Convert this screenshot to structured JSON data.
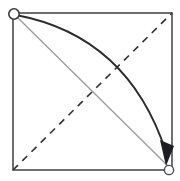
{
  "figure": {
    "canvas": {
      "width": 180,
      "height": 181,
      "background": "#ffffff"
    },
    "square": {
      "name": "square-outline",
      "x": 13,
      "y": 13,
      "width": 159,
      "height": 157,
      "stroke": "#4a4a52",
      "stroke_width": 1.6,
      "fill": "none"
    },
    "dashed_diagonal": {
      "name": "dashed-diagonal-line",
      "from": [
        13,
        170
      ],
      "to": [
        172,
        13
      ],
      "stroke": "#2f2f34",
      "stroke_width": 1.6,
      "dash": "7 6"
    },
    "gray_diagonal": {
      "name": "gray-diagonal-line",
      "from": [
        15,
        15
      ],
      "to": [
        170,
        168
      ],
      "stroke": "#9a9a9e",
      "stroke_width": 1.3
    },
    "curved_arrow": {
      "name": "curved-arrow",
      "from": [
        16,
        15
      ],
      "control": [
        128,
        36
      ],
      "to": [
        166,
        152
      ],
      "stroke": "#2b2b30",
      "stroke_width": 1.8,
      "arrowhead": {
        "name": "arrowhead",
        "points": "160,140 174,146 166,166",
        "fill": "#1d1d22"
      }
    },
    "vertices": [
      {
        "name": "vertex-top-left",
        "cx": 14,
        "cy": 14,
        "r": 5.2,
        "stroke": "#3a3a40",
        "stroke_width": 1.6,
        "fill": "#ffffff"
      },
      {
        "name": "vertex-bottom-right",
        "cx": 169,
        "cy": 170,
        "r": 4.6,
        "stroke": "#4a4a50",
        "stroke_width": 1.4,
        "fill": "#ffffff"
      }
    ]
  }
}
